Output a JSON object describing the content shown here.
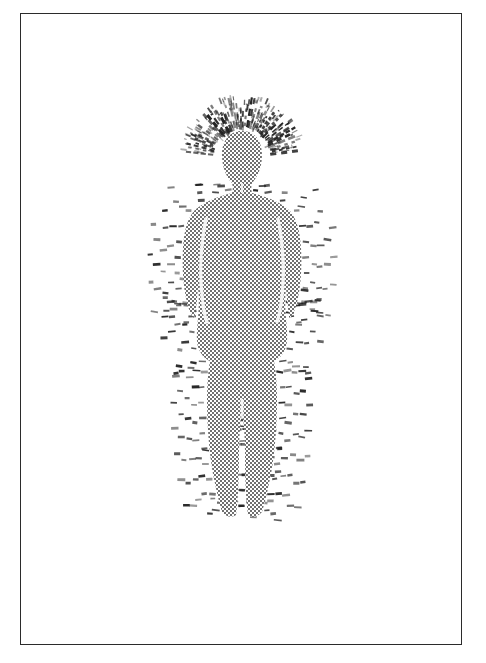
{
  "page": {
    "background_color": "#ffffff",
    "width": 486,
    "height": 663,
    "title": "",
    "caption": ""
  },
  "frame": {
    "name": "border-frame",
    "stroke_color": "#2b2b2b",
    "stroke_width_px": 1.6,
    "x": 20,
    "y": 13,
    "width": 442,
    "height": 632
  },
  "illustration": {
    "subject": "human-figure-with-aura",
    "style": "halftone-dot-screen-print",
    "body_fill_color": "#8a8a8a",
    "body_fill_pattern": "checkerboard-halftone",
    "aura_mark_color": "#1f1f1f",
    "aura_mark_style": "short-dashes",
    "halo_ray_color": "#222222",
    "halo_ray_style": "radiating-lines",
    "gap_color": "#f2f2f2",
    "bounds": {
      "x": 160,
      "y": 95,
      "width": 170,
      "height": 430
    },
    "body": {
      "center_x": 242,
      "head_top_y": 133,
      "head_center_y": 155,
      "head_rx": 19,
      "head_ry": 25,
      "shoulder_y": 196,
      "shoulder_half_width": 42,
      "waist_y": 290,
      "waist_half_width": 30,
      "hip_y": 320,
      "hip_half_width": 38,
      "knee_y": 410,
      "ankle_y": 495,
      "feet_y": 517
    },
    "aura": {
      "band_count": 5,
      "left_extent_x": 168,
      "right_extent_x": 316,
      "top_extent_y": 99,
      "bottom_extent_y": 521
    },
    "halo": {
      "ray_count": 46,
      "inner_radius": 28,
      "outer_radius": 62,
      "center_x": 242,
      "center_y": 158
    }
  }
}
